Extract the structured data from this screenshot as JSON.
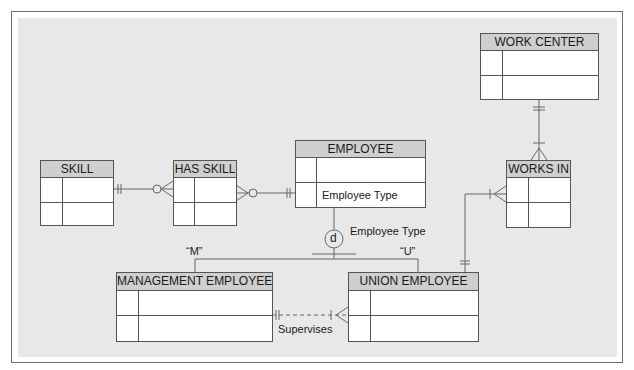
{
  "diagram": {
    "type": "entity-relationship",
    "notation": "crows-foot with supertype/subtype",
    "entities": [
      {
        "id": "work_center",
        "name": "WORK CENTER",
        "attributes": [
          "",
          ""
        ]
      },
      {
        "id": "skill",
        "name": "SKILL",
        "attributes": [
          "",
          ""
        ]
      },
      {
        "id": "has_skill",
        "name": "HAS SKILL",
        "attributes": [
          "",
          ""
        ]
      },
      {
        "id": "employee",
        "name": "EMPLOYEE",
        "attributes": [
          "",
          "Employee Type"
        ]
      },
      {
        "id": "works_in",
        "name": "WORKS IN",
        "attributes": [
          "",
          ""
        ]
      },
      {
        "id": "management_employee",
        "name": "MANAGEMENT EMPLOYEE",
        "attributes": [
          "",
          ""
        ]
      },
      {
        "id": "union_employee",
        "name": "UNION EMPLOYEE",
        "attributes": [
          "",
          ""
        ]
      }
    ],
    "subtype": {
      "symbol": "d",
      "discriminator": "Employee Type",
      "values": [
        {
          "label": "“M”",
          "subtype": "MANAGEMENT EMPLOYEE"
        },
        {
          "label": "“U”",
          "subtype": "UNION EMPLOYEE"
        }
      ]
    },
    "relationships": [
      {
        "from": "SKILL",
        "from_card": "one-and-only-one",
        "to": "HAS SKILL",
        "to_card": "zero-or-many"
      },
      {
        "from": "EMPLOYEE",
        "from_card": "one-and-only-one",
        "to": "HAS SKILL",
        "to_card": "zero-or-many"
      },
      {
        "from": "WORK CENTER",
        "from_card": "one-and-only-one",
        "to": "WORKS IN",
        "to_card": "one-or-many"
      },
      {
        "from": "UNION EMPLOYEE",
        "from_card": "one-and-only-one",
        "to": "WORKS IN",
        "to_card": "one-or-many"
      },
      {
        "from": "MANAGEMENT EMPLOYEE",
        "from_card": "one-and-only-one",
        "to": "UNION EMPLOYEE",
        "to_card": "one-or-many",
        "label": "Supervises",
        "style": "dashed"
      }
    ]
  },
  "labels": {
    "work_center": "WORK CENTER",
    "skill": "SKILL",
    "has_skill": "HAS SKILL",
    "employee": "EMPLOYEE",
    "employee_type_attr": "Employee Type",
    "works_in": "WORKS IN",
    "management_employee": "MANAGEMENT EMPLOYEE",
    "union_employee": "UNION EMPLOYEE",
    "subtype_symbol": "d",
    "discriminator": "Employee Type",
    "m_value": "“M”",
    "u_value": "“U”",
    "supervises": "Supervises"
  },
  "colors": {
    "panel_bg": "#e8e8e8",
    "header_bg": "#cfcfcf",
    "line": "#555555"
  }
}
